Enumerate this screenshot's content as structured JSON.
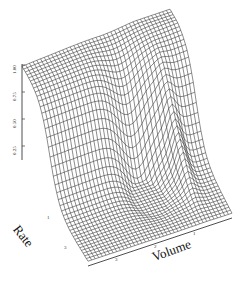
{
  "chart_data": {
    "type": "surface3d",
    "title": "",
    "xlabel": "Volume",
    "ylabel": "Rate",
    "zlabel": "",
    "z_ticks": [
      "0.25",
      "0.50",
      "0.75",
      "1.00"
    ],
    "z_range": [
      0,
      1.0
    ],
    "volume_ticks": [
      "3",
      "2",
      "1"
    ],
    "rate_ticks": [
      "1",
      "3"
    ],
    "grid": false,
    "surface_description": "Wireframe surface: low flat region (~0.05) near front-left (high Rate), rising steeply to a plateau near 1.0 at the back; a valley/trough around Volume 2 with a ridge near Volume 1.2 on the right side.",
    "mesh": {
      "rows": 40,
      "cols": 40
    },
    "line_color": "#1a1a1a"
  },
  "labels": {
    "rate": "Rate",
    "volume": "Volume"
  }
}
